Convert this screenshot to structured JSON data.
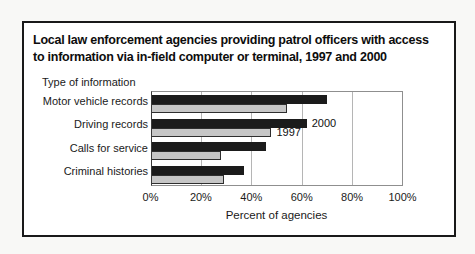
{
  "page": {
    "background": "#f8f8f6"
  },
  "figure": {
    "title_line1": "Local law enforcement agencies providing patrol officers with access",
    "title_line2": "to information via in-field computer or terminal, 1997 and 2000",
    "border_color": "#191919",
    "background": "#ffffff"
  },
  "chart_data": {
    "type": "bar",
    "orientation": "horizontal",
    "title": "Local law enforcement agencies providing patrol officers with access to information via in-field computer or terminal, 1997 and 2000",
    "group_axis_label": "Type of information",
    "categories": [
      "Motor vehicle records",
      "Driving records",
      "Calls for service",
      "Criminal histories"
    ],
    "series": [
      {
        "name": "2000",
        "color": "#1b1b1b",
        "values": [
          70,
          62,
          46,
          37
        ]
      },
      {
        "name": "1997",
        "color": "#c6c6c6",
        "values": [
          54,
          48,
          28,
          29
        ]
      }
    ],
    "series_labels": [
      {
        "text": "2000",
        "series": 0,
        "category": 1
      },
      {
        "text": "1997",
        "series": 1,
        "category": 1
      }
    ],
    "xlabel": "Percent of agencies",
    "xticks": [
      {
        "label": "0%",
        "value": 0
      },
      {
        "label": "20%",
        "value": 20
      },
      {
        "label": "40%",
        "value": 40
      },
      {
        "label": "60%",
        "value": 60
      },
      {
        "label": "80%",
        "value": 80
      },
      {
        "label": "100%",
        "value": 100
      }
    ],
    "xlim": [
      0,
      100
    ],
    "grid": true,
    "gridline_color": "#b5b5b5",
    "legend_position": "inline-annotations"
  }
}
